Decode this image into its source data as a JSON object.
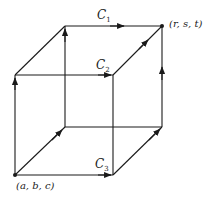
{
  "diagram": {
    "start_point": {
      "label": "(a, b, c)"
    },
    "end_point": {
      "label": "(r, s, t)"
    },
    "paths": [
      {
        "name": "C",
        "subscript": "1",
        "description": "up, back, right along top back edge"
      },
      {
        "name": "C",
        "subscript": "2",
        "description": "up, right along top front edge, back"
      },
      {
        "name": "C",
        "subscript": "3",
        "description": "right along bottom front edge, back, up"
      }
    ],
    "stroke_color": "#1a1a1a",
    "background_color": "#ffffff"
  }
}
